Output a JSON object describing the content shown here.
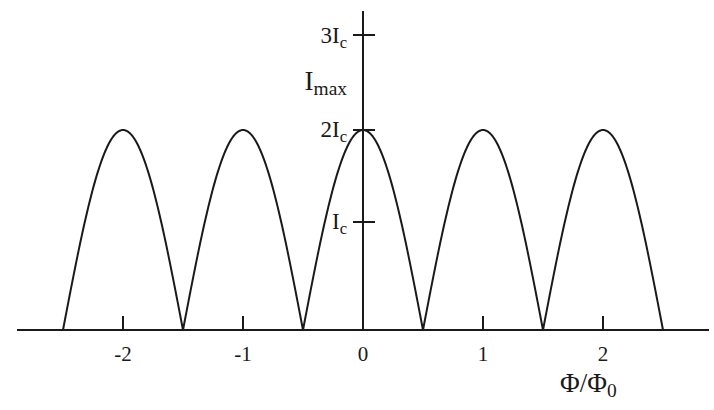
{
  "figure": {
    "background_color": "#ffffff",
    "ink_color": "#1a1a1a",
    "width": 714,
    "height": 410
  },
  "axes": {
    "x_axis_title": "Φ/Φ",
    "x_axis_title_sub": "0",
    "y_axis_title_main": "I",
    "y_axis_title_sub": "max",
    "x_ticks": [
      {
        "label": "-2",
        "value": -2
      },
      {
        "label": "-1",
        "value": -1
      },
      {
        "label": "0",
        "value": 0
      },
      {
        "label": "1",
        "value": 1
      },
      {
        "label": "2",
        "value": 2
      }
    ],
    "y_ticks": [
      {
        "label_main": "3I",
        "label_sub": "c",
        "value": 3
      },
      {
        "label_main": "2I",
        "label_sub": "c",
        "value": 2
      },
      {
        "label_main": "I",
        "label_sub": "c",
        "value": 1
      }
    ],
    "x_range": [
      -2.75,
      2.9
    ],
    "y_range": [
      0,
      3.35
    ]
  },
  "chart_data": {
    "type": "line",
    "title": "",
    "subtitle": "",
    "xlabel": "Φ/Φ0",
    "ylabel": "Imax",
    "xlim": [
      -2.75,
      2.9
    ],
    "ylim": [
      0,
      3.35
    ],
    "grid": false,
    "legend": "none",
    "formula": "Imax = 2*Ic*|cos(pi*Phi/Phi0)|",
    "units": {
      "x": "flux quanta (Phi/Phi0)",
      "y": "critical current in units of Ic"
    },
    "x_tick_values": [
      -2,
      -1,
      0,
      1,
      2
    ],
    "x_tick_labels": [
      "-2",
      "-1",
      "0",
      "1",
      "2"
    ],
    "y_tick_values": [
      1,
      2,
      3
    ],
    "y_tick_labels": [
      "Ic",
      "2Ic",
      "3Ic"
    ],
    "series": [
      {
        "name": "Imax",
        "domain": [
          -2.5,
          2.5
        ],
        "peaks_x": [
          -2,
          -1,
          0,
          1,
          2
        ],
        "peaks_y": [
          2,
          2,
          2,
          2,
          2
        ],
        "zeros_x": [
          -2.5,
          -1.5,
          -0.5,
          0.5,
          1.5,
          2.5
        ],
        "zeros_y": [
          0,
          0,
          0,
          0,
          0,
          0
        ],
        "x": [
          -2.5,
          -2.4,
          -2.3,
          -2.2,
          -2.1,
          -2.0,
          -1.9,
          -1.8,
          -1.7,
          -1.6,
          -1.5,
          -1.4,
          -1.3,
          -1.2,
          -1.1,
          -1.0,
          -0.9,
          -0.8,
          -0.7,
          -0.6,
          -0.5,
          -0.4,
          -0.3,
          -0.2,
          -0.1,
          0.0,
          0.1,
          0.2,
          0.3,
          0.4,
          0.5,
          0.6,
          0.7,
          0.8,
          0.9,
          1.0,
          1.1,
          1.2,
          1.3,
          1.4,
          1.5,
          1.6,
          1.7,
          1.8,
          1.9,
          2.0,
          2.1,
          2.2,
          2.3,
          2.4,
          2.5
        ],
        "y": [
          0.0,
          0.31,
          0.62,
          0.91,
          1.18,
          1.41,
          1.62,
          1.78,
          1.9,
          1.98,
          2.0,
          1.98,
          1.9,
          1.78,
          1.62,
          1.41,
          1.18,
          0.91,
          0.62,
          0.31,
          0.0,
          0.31,
          0.62,
          0.91,
          1.18,
          1.41,
          1.18,
          0.91,
          0.62,
          0.31,
          0.0,
          0.31,
          0.62,
          0.91,
          1.18,
          1.41,
          1.62,
          1.78,
          1.9,
          1.98,
          2.0,
          1.98,
          1.9,
          1.78,
          1.62,
          1.41,
          1.18,
          0.91,
          0.62,
          0.31,
          0.0
        ]
      }
    ]
  }
}
